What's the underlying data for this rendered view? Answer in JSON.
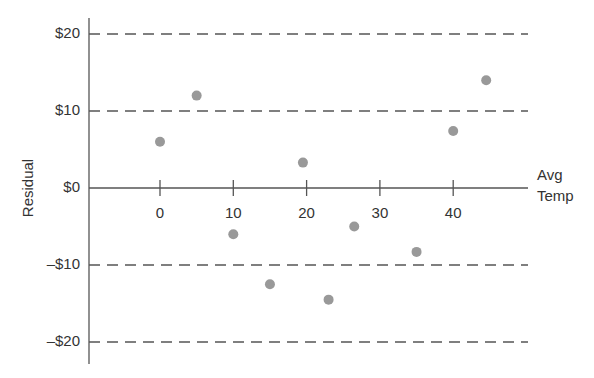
{
  "chart_data": {
    "type": "scatter",
    "title": "",
    "xlabel": "Avg Temp",
    "xlabel_lines": [
      "Avg",
      "Temp"
    ],
    "ylabel": "Residual",
    "x_ticks": [
      0,
      10,
      20,
      30,
      40
    ],
    "x_tick_labels": [
      "0",
      "10",
      "20",
      "30",
      "40"
    ],
    "y_ticks": [
      20,
      10,
      0,
      -10,
      -20
    ],
    "y_tick_labels": [
      "$20",
      "$10",
      "$0",
      "–$10",
      "–$20"
    ],
    "xlim": [
      -10,
      50
    ],
    "ylim": [
      -22,
      22
    ],
    "grid": "dashed horizontal lines at ±10, ±20",
    "legend": null,
    "series": [
      {
        "name": "Residuals",
        "color": "#999999",
        "points": [
          {
            "x": 0,
            "y": 6
          },
          {
            "x": 5,
            "y": 12
          },
          {
            "x": 10,
            "y": -6
          },
          {
            "x": 15,
            "y": -12.5
          },
          {
            "x": 19.5,
            "y": 3.3
          },
          {
            "x": 23,
            "y": -14.5
          },
          {
            "x": 26.5,
            "y": -5
          },
          {
            "x": 35,
            "y": -8.3
          },
          {
            "x": 40,
            "y": 7.4
          },
          {
            "x": 44.5,
            "y": 14
          }
        ]
      }
    ]
  },
  "colors": {
    "axis": "#555555",
    "grid": "#555555",
    "point": "#999999",
    "text": "#333333"
  }
}
